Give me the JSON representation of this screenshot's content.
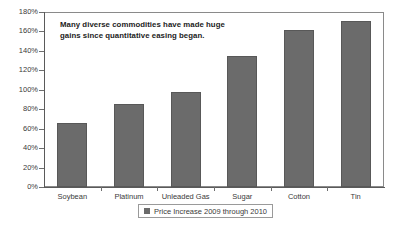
{
  "chart_data": {
    "type": "bar",
    "title": "",
    "subtitle": "",
    "xlabel": "",
    "ylabel": "",
    "categories": [
      "Soybean",
      "Platinum",
      "Unleaded Gas",
      "Sugar",
      "Cotton",
      "Tin"
    ],
    "values": [
      66,
      85,
      98,
      135,
      161,
      171
    ],
    "value_unit": "%",
    "ylim": [
      0,
      180
    ],
    "ytick_labels": [
      "0%",
      "20%",
      "40%",
      "60%",
      "80%",
      "100%",
      "120%",
      "140%",
      "160%",
      "180%"
    ],
    "ytick_values": [
      0,
      20,
      40,
      60,
      80,
      100,
      120,
      140,
      160,
      180
    ],
    "grid": false,
    "legend_position": "bottom",
    "series": [
      {
        "name": "Price Increase 2009 through 2010",
        "color": "#6b6b6b",
        "values": [
          66,
          85,
          98,
          135,
          161,
          171
        ]
      }
    ],
    "annotations": [
      {
        "text": "Many diverse commodities have made huge gains since quantitative easing began.",
        "position": "top-left-inside-plot"
      }
    ]
  },
  "legend": {
    "label": "Price Increase 2009 through 2010"
  },
  "annotation": {
    "line1": "Many diverse commodities have made huge",
    "line2": "gains since quantitative easing began."
  },
  "colors": {
    "bar_fill": "#6b6b6b",
    "bar_border": "#585858",
    "axis": "#5a5a5a",
    "frame": "#8a8a8a",
    "text": "#3a3a3a",
    "background": "#ffffff"
  }
}
